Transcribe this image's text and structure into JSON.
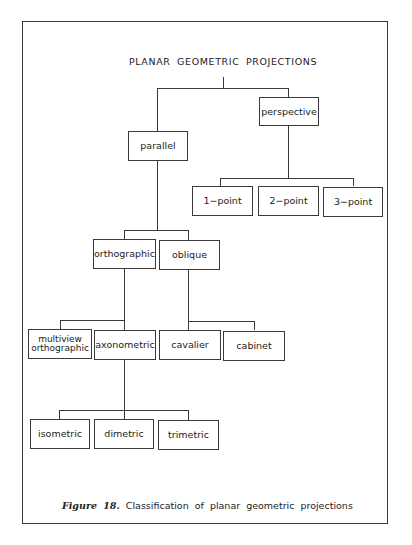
{
  "diagram": {
    "title": "PLANAR GEOMETRIC PROJECTIONS",
    "nodes": {
      "perspective": "perspective",
      "parallel": "parallel",
      "one_point": "1−point",
      "two_point": "2−point",
      "three_point": "3−point",
      "orthographic": "orthographic",
      "oblique": "oblique",
      "multiview_line1": "multiview",
      "multiview_line2": "orthographic",
      "axonometric": "axonometric",
      "cavalier": "cavalier",
      "cabinet": "cabinet",
      "isometric": "isometric",
      "dimetric": "dimetric",
      "trimetric": "trimetric"
    },
    "tree": {
      "label": "PLANAR GEOMETRIC PROJECTIONS",
      "children": [
        {
          "label": "parallel",
          "children": [
            {
              "label": "orthographic",
              "children": [
                {
                  "label": "multiview orthographic"
                },
                {
                  "label": "axonometric",
                  "children": [
                    {
                      "label": "isometric"
                    },
                    {
                      "label": "dimetric"
                    },
                    {
                      "label": "trimetric"
                    }
                  ]
                }
              ]
            },
            {
              "label": "oblique",
              "children": [
                {
                  "label": "cavalier"
                },
                {
                  "label": "cabinet"
                }
              ]
            }
          ]
        },
        {
          "label": "perspective",
          "children": [
            {
              "label": "1-point"
            },
            {
              "label": "2-point"
            },
            {
              "label": "3-point"
            }
          ]
        }
      ]
    }
  },
  "caption": {
    "figure_label": "Figure 18.",
    "text": "Classification of planar geometric projections"
  }
}
